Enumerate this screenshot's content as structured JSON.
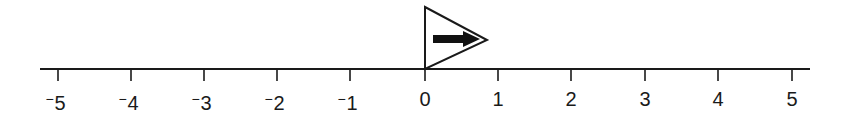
{
  "diagram": {
    "type": "number-line",
    "line": {
      "x_start": 40,
      "x_end": 810,
      "y": 69,
      "color": "#1a1a1a"
    },
    "ticks": [
      {
        "value": -5,
        "sign": "⁻",
        "digit": "5",
        "x": 58
      },
      {
        "value": -4,
        "sign": "⁻",
        "digit": "4",
        "x": 131
      },
      {
        "value": -3,
        "sign": "⁻",
        "digit": "3",
        "x": 204
      },
      {
        "value": -2,
        "sign": "⁻",
        "digit": "2",
        "x": 277
      },
      {
        "value": -1,
        "sign": "⁻",
        "digit": "1",
        "x": 350
      },
      {
        "value": 0,
        "sign": "",
        "digit": "0",
        "x": 425
      },
      {
        "value": 1,
        "sign": "",
        "digit": "1",
        "x": 498
      },
      {
        "value": 2,
        "sign": "",
        "digit": "2",
        "x": 571
      },
      {
        "value": 3,
        "sign": "",
        "digit": "3",
        "x": 645
      },
      {
        "value": 4,
        "sign": "",
        "digit": "4",
        "x": 718
      },
      {
        "value": 5,
        "sign": "",
        "digit": "5",
        "x": 792
      }
    ],
    "marker": {
      "shape": "triangle-flag",
      "position_value": 0,
      "direction": "right",
      "icon": "right-arrow-icon"
    },
    "colors": {
      "ink": "#1a1a1a",
      "background": "#ffffff"
    }
  }
}
